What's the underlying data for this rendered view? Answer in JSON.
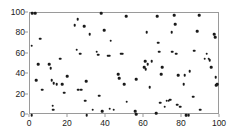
{
  "chart_data": {
    "type": "scatter",
    "title": "",
    "xlabel": "",
    "ylabel": "",
    "xlim": [
      0,
      100
    ],
    "ylim": [
      0,
      100
    ],
    "xticks": [
      0,
      20,
      40,
      60,
      80,
      100
    ],
    "yticks": [
      0,
      20,
      40,
      60,
      80,
      100
    ],
    "grid": false,
    "legend": null,
    "marker": {
      "shape": "circle",
      "color": "#1a1a1a",
      "size": 2.6
    },
    "axes_color": "#9a9a9a",
    "background": "#ffffff",
    "series": [
      {
        "name": "points",
        "points": [
          [
            1.2,
            100
          ],
          [
            2.6,
            100
          ],
          [
            1.0,
            68
          ],
          [
            3.2,
            34
          ],
          [
            4.2,
            50
          ],
          [
            5.5,
            75
          ],
          [
            6.5,
            25
          ],
          [
            1.0,
            0
          ],
          [
            10.0,
            50
          ],
          [
            11.0,
            46
          ],
          [
            11.5,
            34
          ],
          [
            12.0,
            9
          ],
          [
            12.3,
            5
          ],
          [
            12.5,
            31
          ],
          [
            14.0,
            30
          ],
          [
            16.0,
            55
          ],
          [
            17.0,
            30
          ],
          [
            18.0,
            22
          ],
          [
            19.5,
            38
          ],
          [
            23.5,
            88
          ],
          [
            24.5,
            64
          ],
          [
            25.0,
            94
          ],
          [
            25.5,
            25
          ],
          [
            26.5,
            60
          ],
          [
            27.0,
            25
          ],
          [
            28.5,
            87
          ],
          [
            29.5,
            33
          ],
          [
            29.0,
            14
          ],
          [
            29.8,
            0
          ],
          [
            31.5,
            79
          ],
          [
            33.0,
            5
          ],
          [
            35.0,
            62
          ],
          [
            35.8,
            59
          ],
          [
            36.5,
            19
          ],
          [
            37.5,
            100
          ],
          [
            38.0,
            4
          ],
          [
            39.0,
            83
          ],
          [
            41.0,
            58
          ],
          [
            41.8,
            58
          ],
          [
            42.5,
            73
          ],
          [
            42.0,
            6
          ],
          [
            44.0,
            5
          ],
          [
            46.5,
            40
          ],
          [
            47.0,
            36
          ],
          [
            48.0,
            60
          ],
          [
            48.8,
            60
          ],
          [
            49.5,
            30
          ],
          [
            50.5,
            97
          ],
          [
            51.0,
            13
          ],
          [
            55.5,
            4
          ],
          [
            55.8,
            1
          ],
          [
            56.0,
            35
          ],
          [
            60.0,
            47
          ],
          [
            60.5,
            53
          ],
          [
            61.0,
            45
          ],
          [
            61.5,
            81
          ],
          [
            62.0,
            50
          ],
          [
            63.0,
            27
          ],
          [
            64.0,
            53
          ],
          [
            66.5,
            2
          ],
          [
            67.0,
            97
          ],
          [
            67.5,
            71
          ],
          [
            68.0,
            62
          ],
          [
            68.5,
            12
          ],
          [
            69.0,
            40
          ],
          [
            69.5,
            47
          ],
          [
            71.0,
            8
          ],
          [
            72.0,
            14
          ],
          [
            73.0,
            14
          ],
          [
            73.5,
            15
          ],
          [
            74.0,
            15
          ],
          [
            74.5,
            81
          ],
          [
            74.8,
            62
          ],
          [
            76.0,
            98
          ],
          [
            76.5,
            89
          ],
          [
            77.0,
            60
          ],
          [
            77.5,
            10
          ],
          [
            78.0,
            39
          ],
          [
            79.0,
            8
          ],
          [
            81.0,
            30
          ],
          [
            81.5,
            39
          ],
          [
            82.0,
            0
          ],
          [
            82.5,
            0
          ],
          [
            83.5,
            0
          ],
          [
            84.0,
            43
          ],
          [
            86.0,
            18
          ],
          [
            86.5,
            63
          ],
          [
            88.0,
            82
          ],
          [
            89.0,
            98
          ],
          [
            89.5,
            5
          ],
          [
            92.0,
            55
          ],
          [
            93.0,
            60
          ],
          [
            94.0,
            55
          ],
          [
            94.5,
            54
          ],
          [
            95.5,
            47
          ],
          [
            97.0,
            79
          ],
          [
            97.5,
            76
          ],
          [
            97.8,
            37
          ],
          [
            98.0,
            29
          ],
          [
            98.5,
            30
          ]
        ]
      }
    ]
  }
}
